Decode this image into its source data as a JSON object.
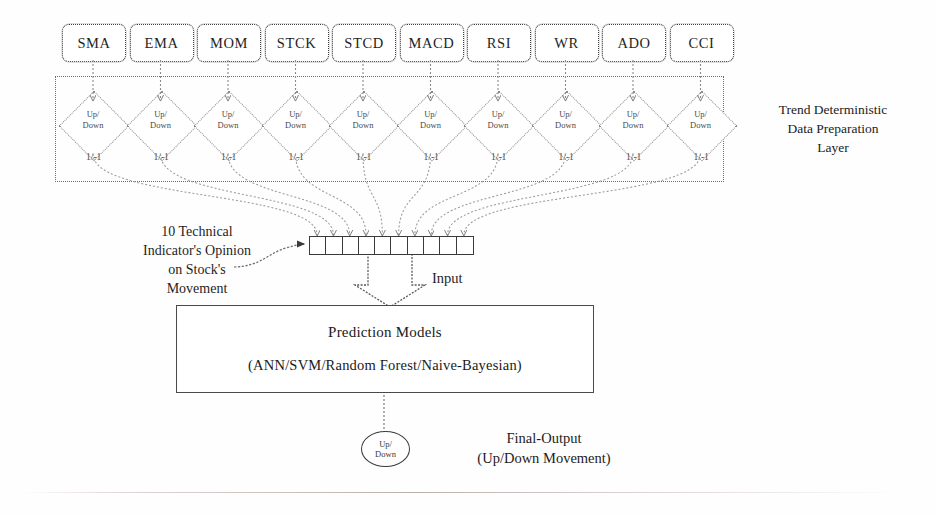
{
  "diagram": {
    "indicators": [
      {
        "label": "SMA"
      },
      {
        "label": "EMA"
      },
      {
        "label": "MOM"
      },
      {
        "label": "STCK"
      },
      {
        "label": "STCD"
      },
      {
        "label": "MACD"
      },
      {
        "label": "RSI"
      },
      {
        "label": "WR"
      },
      {
        "label": "ADO"
      },
      {
        "label": "CCI"
      }
    ],
    "decision_node": {
      "label": "Up/\nDown",
      "value_label": "1/-1"
    },
    "layer_caption": "Trend Deterministic\nData Preparation\nLayer",
    "opinion_caption": "10 Technical\nIndicator's Opinion\non Stock's\nMovement",
    "input_vector": {
      "cell_count": 10,
      "arrow_label": "Input"
    },
    "prediction_models": {
      "title": "Prediction Models",
      "subtitle": "(ANN/SVM/Random Forest/Naive-Bayesian)"
    },
    "final_output": {
      "node_label": "Up/\nDown",
      "caption": "Final-Output\n(Up/Down Movement)"
    },
    "colors": {
      "ink": "#2b2b2b",
      "dotted_border": "#6d6d6d",
      "solid_border": "#3a3a3a",
      "background": "#ffffff"
    }
  }
}
